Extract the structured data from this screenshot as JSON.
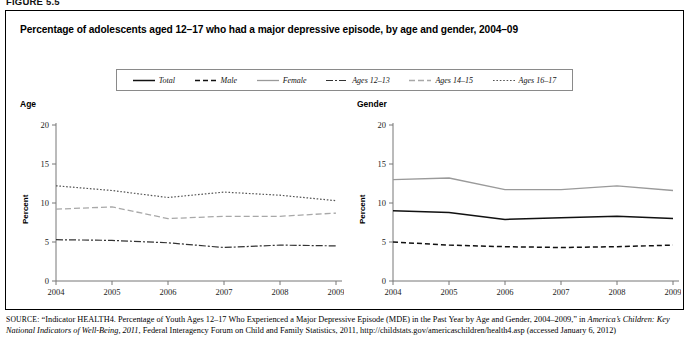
{
  "figure_label": "FIGURE 5.5",
  "chart_title": "Percentage of adolescents aged 12–17 who had a major depressive episode, by age and gender, 2004–09",
  "legend": {
    "items": [
      {
        "label": "Total",
        "style": "solid-dark"
      },
      {
        "label": "Male",
        "style": "dashed-dark"
      },
      {
        "label": "Female",
        "style": "solid-light"
      },
      {
        "label": "Ages 12–13",
        "style": "dashdot-dark"
      },
      {
        "label": "Ages 14–15",
        "style": "dashed-light"
      },
      {
        "label": "Ages 16–17",
        "style": "dotted-dark"
      }
    ]
  },
  "panels": {
    "left": {
      "label": "Age",
      "ylabel": "Percent"
    },
    "right": {
      "label": "Gender",
      "ylabel": "Percent"
    }
  },
  "source": {
    "prefix": "SOURCE:",
    "part1": " “Indicator HEALTH4. Percentage of Youth Ages 12–17 Who Experienced a Major Depressive Episode (MDE) in the Past Year by Age and Gender, 2004–2009,” in ",
    "italic1": "America’s Children: Key National Indicators of Well-Being, 2011",
    "part2": ", Federal Interagency Forum on Child and Family Statistics, 2011, http://childstats.gov/americaschildren/health4.asp (accessed January 6, 2012)"
  },
  "chart_data": [
    {
      "type": "line",
      "title": "Age",
      "xlabel": "",
      "ylabel": "Percent",
      "x": [
        "2004",
        "2005",
        "2006",
        "2007",
        "2008",
        "2009"
      ],
      "ylim": [
        0,
        20
      ],
      "yticks": [
        0,
        5,
        10,
        15,
        20
      ],
      "grid": false,
      "legend_position": "top-shared",
      "series": [
        {
          "name": "Ages 12–13",
          "style": "dashdot-dark",
          "values": [
            5.3,
            5.2,
            4.9,
            4.3,
            4.6,
            4.5
          ]
        },
        {
          "name": "Ages 14–15",
          "style": "dashed-light",
          "values": [
            9.2,
            9.5,
            8.0,
            8.3,
            8.3,
            8.7
          ]
        },
        {
          "name": "Ages 16–17",
          "style": "dotted-dark",
          "values": [
            12.2,
            11.6,
            10.7,
            11.4,
            11.0,
            10.3
          ]
        }
      ]
    },
    {
      "type": "line",
      "title": "Gender",
      "xlabel": "",
      "ylabel": "Percent",
      "x": [
        "2004",
        "2005",
        "2006",
        "2007",
        "2008",
        "2009"
      ],
      "ylim": [
        0,
        20
      ],
      "yticks": [
        0,
        5,
        10,
        15,
        20
      ],
      "grid": false,
      "legend_position": "top-shared",
      "series": [
        {
          "name": "Male",
          "style": "dashed-dark",
          "values": [
            5.0,
            4.6,
            4.4,
            4.3,
            4.4,
            4.6
          ]
        },
        {
          "name": "Total",
          "style": "solid-dark",
          "values": [
            9.0,
            8.8,
            7.9,
            8.1,
            8.3,
            8.0
          ]
        },
        {
          "name": "Female",
          "style": "solid-light",
          "values": [
            13.0,
            13.2,
            11.7,
            11.7,
            12.2,
            11.6
          ]
        }
      ]
    }
  ]
}
